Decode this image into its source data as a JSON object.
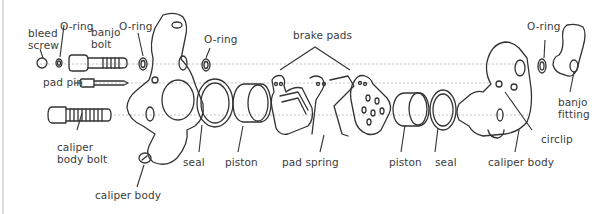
{
  "diagram": {
    "colors": {
      "line": "#333333",
      "guide": "#b8b8b8",
      "text": "#3c3c3c",
      "border": "#dcdcdc"
    },
    "labels": {
      "bleed_screw": [
        "bleed",
        "screw"
      ],
      "oring_1": "O-ring",
      "banjo_bolt": [
        "banjo",
        "bolt"
      ],
      "oring_2": "O-ring",
      "pad_pin": "pad pin",
      "caliper_body_bolt": [
        "caliper",
        "body bolt"
      ],
      "caliper_body_left": "caliper body",
      "oring_3": "O-ring",
      "brake_pads": "brake pads",
      "seal_left": "seal",
      "piston_left": "piston",
      "pad_spring": "pad spring",
      "piston_right": "piston",
      "seal_right": "seal",
      "caliper_body_right": "caliper body",
      "circlip": "circlip",
      "oring_4": "O-ring",
      "banjo_fitting": [
        "banjo",
        "fitting"
      ]
    }
  }
}
